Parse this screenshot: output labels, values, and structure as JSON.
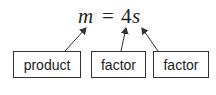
{
  "equation": {
    "lhs": "m",
    "equals": "=",
    "coefficient": "4",
    "variable": "s"
  },
  "labels": [
    {
      "text": "product",
      "points_to": "m"
    },
    {
      "text": "factor",
      "points_to": "4"
    },
    {
      "text": "factor",
      "points_to": "s"
    }
  ],
  "colors": {
    "stroke": "#333333",
    "text": "#222222",
    "background": "#ffffff"
  }
}
